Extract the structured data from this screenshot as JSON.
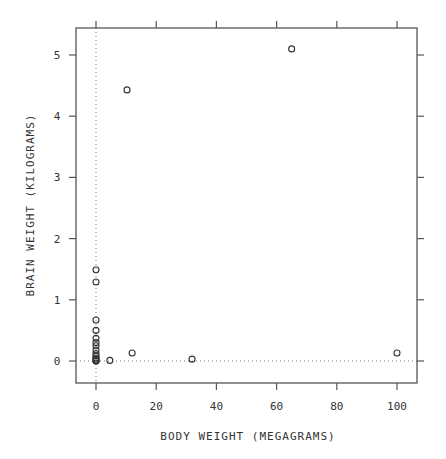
{
  "chart_data": {
    "type": "scatter",
    "title": "",
    "xlabel": "BODY WEIGHT (MEGAGRAMS)",
    "ylabel": "BRAIN WEIGHT (KILOGRAMS)",
    "xlim": [
      -7,
      107
    ],
    "ylim": [
      -0.37,
      5.45
    ],
    "xticks": [
      0,
      20,
      40,
      60,
      80,
      100
    ],
    "yticks": [
      0,
      1,
      2,
      3,
      4,
      5
    ],
    "grid": false,
    "reference_lines": {
      "x": 0,
      "y": 0,
      "style": "dotted"
    },
    "marker": "open-circle",
    "legend": null,
    "points": [
      {
        "x": 65.0,
        "y": 5.1
      },
      {
        "x": 10.3,
        "y": 4.43
      },
      {
        "x": 100.0,
        "y": 0.13
      },
      {
        "x": 31.9,
        "y": 0.03
      },
      {
        "x": 12.0,
        "y": 0.13
      },
      {
        "x": 4.6,
        "y": 0.01
      },
      {
        "x": 0.0,
        "y": 1.49
      },
      {
        "x": 0.0,
        "y": 1.29
      },
      {
        "x": 0.0,
        "y": 0.67
      },
      {
        "x": 0.0,
        "y": 0.5
      },
      {
        "x": 0.0,
        "y": 0.37
      },
      {
        "x": 0.0,
        "y": 0.3
      },
      {
        "x": 0.0,
        "y": 0.25
      },
      {
        "x": 0.0,
        "y": 0.18
      },
      {
        "x": 0.0,
        "y": 0.12
      },
      {
        "x": 0.0,
        "y": 0.08
      },
      {
        "x": 0.0,
        "y": 0.05
      },
      {
        "x": 0.0,
        "y": 0.03
      },
      {
        "x": 0.0,
        "y": 0.01
      },
      {
        "x": 0.0,
        "y": 0.0
      },
      {
        "x": 0.0,
        "y": 0.0
      }
    ]
  },
  "axes": {
    "x_tick_labels": [
      "0",
      "20",
      "40",
      "60",
      "80",
      "100"
    ],
    "y_tick_labels": [
      "0",
      "1",
      "2",
      "3",
      "4",
      "5"
    ]
  },
  "colors": {
    "axis": "#555555",
    "marker": "#333333",
    "refline": "#777777"
  }
}
